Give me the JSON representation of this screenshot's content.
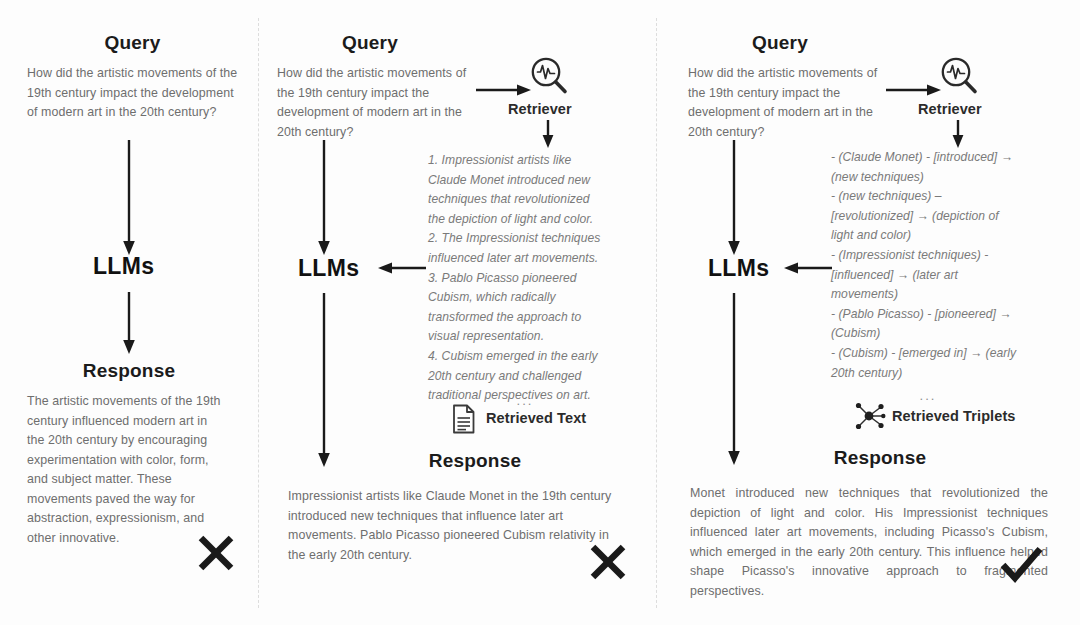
{
  "diagram": {
    "columns": [
      {
        "id": "vanilla-llm",
        "query_title": "Query",
        "query_text": "How did the artistic movements of the 19th century impact the development of modern art in the 20th century?",
        "llm_label": "LLMs",
        "response_title": "Response",
        "response_text": "The artistic movements of the 19th century influenced modern art in the 20th century by encouraging experimentation with color, form, and subject matter. These movements paved the way for abstraction, expressionism, and other innovative.",
        "verdict": "incorrect",
        "verdict_icon": "cross-icon"
      },
      {
        "id": "text-rag",
        "query_title": "Query",
        "query_text": "How did the artistic movements of the 19th century impact the development of modern art in the 20th century?",
        "retriever_label": "Retriever",
        "retriever_icon": "magnifier-pulse-icon",
        "retrieved_label": "Retrieved Text",
        "retrieved_icon": "document-icon",
        "retrieved_ellipsis": "...",
        "retrieved_lines": [
          "1. Impressionist artists like",
          "Claude Monet introduced new",
          "techniques that revolutionized",
          "the depiction of light and color.",
          "2. The Impressionist techniques",
          "influenced later art movements.",
          "3. Pablo Picasso pioneered",
          "Cubism, which radically",
          "transformed the approach to",
          "visual representation.",
          "4. Cubism emerged in the early",
          "20th century and challenged",
          "traditional perspectives on art."
        ],
        "llm_label": "LLMs",
        "response_title": "Response",
        "response_text": "Impressionist artists like Claude Monet in the 19th century introduced new techniques that influence later art movements. Pablo Picasso pioneered Cubism relativity in the early 20th century.",
        "verdict": "incorrect",
        "verdict_icon": "cross-icon"
      },
      {
        "id": "graph-rag",
        "query_title": "Query",
        "query_text": "How did the artistic movements of the 19th century impact the development of modern art in the 20th century?",
        "retriever_label": "Retriever",
        "retriever_icon": "magnifier-pulse-icon",
        "retrieved_label": "Retrieved Triplets",
        "retrieved_icon": "graph-nodes-icon",
        "retrieved_ellipsis": "...",
        "retrieved_lines": [
          "- (Claude Monet) - [introduced] →",
          "(new techniques)",
          "- (new techniques) –",
          "[revolutionized] → (depiction of",
          "light and color)",
          "- (Impressionist techniques) -",
          "[influenced] → (later art",
          "movements)",
          "- (Pablo Picasso) - [pioneered] →",
          "(Cubism)",
          "- (Cubism) - [emerged in] → (early",
          "20th century)"
        ],
        "llm_label": "LLMs",
        "response_title": "Response",
        "response_text": "Monet introduced new techniques that revolutionized the depiction of light and color. His Impressionist techniques influenced later art movements, including Picasso's Cubism, which emerged in the early 20th century. This influence helped shape Picasso's innovative approach to fragmented perspectives.",
        "verdict": "correct",
        "verdict_icon": "check-icon"
      }
    ],
    "colors": {
      "ink": "#1b1b1b",
      "body": "#6e6e6e",
      "italic": "#7a7a7a",
      "arrow": "#1a1a1a",
      "divider": "#d8d8d8",
      "background": "#fdfdfd"
    }
  }
}
